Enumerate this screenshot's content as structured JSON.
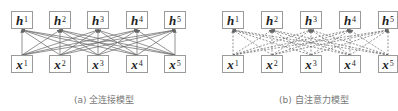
{
  "panels": [
    {
      "id": "a",
      "caption": "(a) 全连接模型",
      "edge_style": "solid",
      "outputs": [
        {
          "var": "h",
          "sub": "1"
        },
        {
          "var": "h",
          "sub": "2"
        },
        {
          "var": "h",
          "sub": "3"
        },
        {
          "var": "h",
          "sub": "4"
        },
        {
          "var": "h",
          "sub": "5"
        }
      ],
      "inputs": [
        {
          "var": "x",
          "sub": "1"
        },
        {
          "var": "x",
          "sub": "2"
        },
        {
          "var": "x",
          "sub": "3"
        },
        {
          "var": "x",
          "sub": "4"
        },
        {
          "var": "x",
          "sub": "5"
        }
      ]
    },
    {
      "id": "b",
      "caption": "(b) 自注意力模型",
      "edge_style": "dashed",
      "outputs": [
        {
          "var": "h",
          "sub": "1"
        },
        {
          "var": "h",
          "sub": "2"
        },
        {
          "var": "h",
          "sub": "3"
        },
        {
          "var": "h",
          "sub": "4"
        },
        {
          "var": "h",
          "sub": "5"
        }
      ],
      "inputs": [
        {
          "var": "x",
          "sub": "1"
        },
        {
          "var": "x",
          "sub": "2"
        },
        {
          "var": "x",
          "sub": "3"
        },
        {
          "var": "x",
          "sub": "4"
        },
        {
          "var": "x",
          "sub": "5"
        }
      ]
    }
  ],
  "colors": {
    "edge": "#666666",
    "node_border": "#9a9a9a",
    "caption": "#777777"
  }
}
